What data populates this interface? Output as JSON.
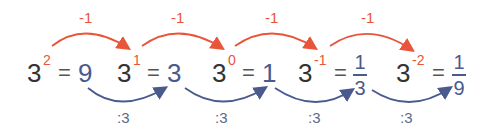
{
  "colors": {
    "minus_arrow": "#e8553a",
    "divide_arrow": "#4a5a8e",
    "base": "#333333"
  },
  "terms": [
    {
      "base": "3",
      "exponent": "2",
      "equals": "=",
      "value": "9"
    },
    {
      "base": "3",
      "exponent": "1",
      "equals": "=",
      "value": "3"
    },
    {
      "base": "3",
      "exponent": "0",
      "equals": "=",
      "value": "1"
    },
    {
      "base": "3",
      "exponent": "-1",
      "equals": "=",
      "value_num": "1",
      "value_den": "3"
    },
    {
      "base": "3",
      "exponent": "-2",
      "equals": "=",
      "value_num": "1",
      "value_den": "9"
    }
  ],
  "top_arrows": [
    {
      "label": "-1"
    },
    {
      "label": "-1"
    },
    {
      "label": "-1"
    },
    {
      "label": "-1"
    }
  ],
  "bottom_arrows": [
    {
      "label": ":3"
    },
    {
      "label": ":3"
    },
    {
      "label": ":3"
    },
    {
      "label": ":3"
    }
  ]
}
